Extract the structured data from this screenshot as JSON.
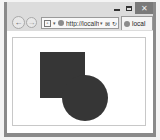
{
  "window": {
    "controls": {
      "minimize_icon": "minimize-icon",
      "maximize_icon": "maximize-icon",
      "close_label": "✕"
    }
  },
  "toolbar": {
    "back_label": "←",
    "forward_label": "→",
    "address": {
      "compat_icon_label": "▫",
      "dropdown_label": "▾",
      "url": "http://localho...",
      "search_dropdown": "▾",
      "tail_icons": "⊠ ↻"
    },
    "tab": {
      "title": "local"
    }
  },
  "page": {
    "shapes": [
      {
        "type": "square",
        "color": "#363636"
      },
      {
        "type": "circle",
        "color": "#363636"
      }
    ]
  }
}
